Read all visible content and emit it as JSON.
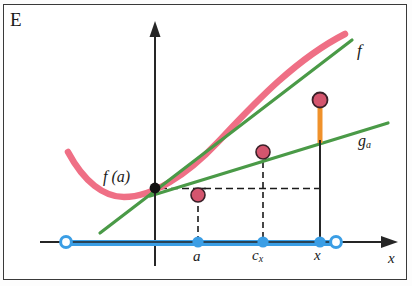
{
  "figure": {
    "panel_label": "E",
    "background": "#ffffff",
    "border_color": "#3a3a3a",
    "width": 412,
    "height": 286
  },
  "axes": {
    "x_axis_label": "x",
    "y_axis_x": 155,
    "x_axis_y": 242,
    "x_axis_arrow_tip": 398,
    "y_axis_arrow_tip": 25,
    "axis_color": "#262626"
  },
  "colors": {
    "curve_f": "#ef6f85",
    "tangent_green": "#4a9a47",
    "secant_green": "#4a9a47",
    "gap_orange": "#f0922b",
    "interval_blue": "#3b9ee5",
    "point_crimson": "#d4556e",
    "point_black": "#111111",
    "dashed": "#1a1a1a"
  },
  "curves": [
    {
      "name": "f",
      "label": "f",
      "type": "convex-curve",
      "color": "#ef6f85",
      "label_position": {
        "x": 357,
        "y": 41
      }
    },
    {
      "name": "g_a",
      "label": "g",
      "label_sub": "a",
      "type": "line",
      "color": "#4a9a47",
      "label_position": {
        "x": 358,
        "y": 132
      }
    },
    {
      "name": "tangent_at_a",
      "label": "",
      "type": "line",
      "color": "#4a9a47"
    }
  ],
  "points": [
    {
      "name": "f-of-a-value",
      "label": "f (a)",
      "kind": "black-dot",
      "x": 155,
      "y": 188
    },
    {
      "name": "point-on-f-at-a",
      "kind": "crimson-dot",
      "x": 198,
      "y": 195
    },
    {
      "name": "point-on-f-at-cx",
      "kind": "crimson-dot",
      "x": 263,
      "y": 152
    },
    {
      "name": "point-on-f-at-x",
      "kind": "crimson-dot",
      "x": 320,
      "y": 100
    }
  ],
  "ticks": [
    {
      "name": "a",
      "label": "a",
      "sub": "",
      "x": 198,
      "kind": "filled-blue"
    },
    {
      "name": "c_x",
      "label": "c",
      "sub": "x",
      "x": 263,
      "kind": "filled-blue"
    },
    {
      "name": "x",
      "label": "x",
      "sub": "",
      "x": 320,
      "kind": "filled-blue"
    }
  ],
  "interval": {
    "name": "domain-interval",
    "left_endpoint_x": 66,
    "right_endpoint_x": 336,
    "y": 242,
    "left_open": true,
    "right_open": true,
    "color": "#3b9ee5"
  },
  "gap_segment": {
    "name": "f-minus-ga-gap",
    "x": 320,
    "y_top": 104,
    "y_bottom": 143,
    "color": "#f0922b"
  }
}
